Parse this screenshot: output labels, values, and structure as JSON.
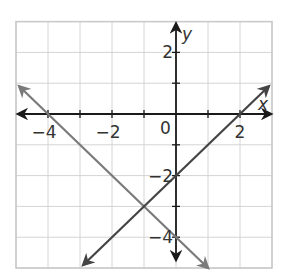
{
  "chart_data": {
    "type": "line",
    "title": "",
    "xlabel": "x",
    "ylabel": "y",
    "xlim": [
      -5,
      3
    ],
    "ylim": [
      -5,
      3
    ],
    "grid": true,
    "x_tick_labels": [
      {
        "value": -4,
        "label": "−4"
      },
      {
        "value": -2,
        "label": "−2"
      },
      {
        "value": 2,
        "label": "2"
      }
    ],
    "y_tick_labels": [
      {
        "value": 2,
        "label": "2"
      },
      {
        "value": -2,
        "label": "−2"
      },
      {
        "value": -4,
        "label": "−4"
      }
    ],
    "origin_label": "0",
    "series": [
      {
        "name": "y = -x - 4",
        "slope": -1,
        "intercept": -4,
        "color": "#7a7a7a",
        "x": [
          -4.9,
          1.0
        ],
        "y": [
          0.9,
          -5.0
        ]
      },
      {
        "name": "y = x - 2",
        "slope": 1,
        "intercept": -2,
        "color": "#444444",
        "x": [
          -2.9,
          2.9
        ],
        "y": [
          -4.9,
          0.9
        ]
      }
    ],
    "intersection": {
      "x": -1,
      "y": -3
    }
  },
  "colors": {
    "grid": "#d4d4d4",
    "border": "#c8c8c8",
    "axis": "#1a1a1a"
  }
}
